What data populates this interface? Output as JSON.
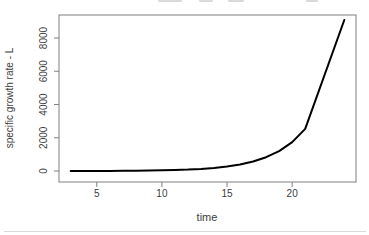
{
  "window": {
    "background_color": "#ffffff"
  },
  "chart_data": {
    "type": "line",
    "title": "",
    "xlabel": "time",
    "ylabel": "specific growth rate - L",
    "x": [
      3,
      4,
      5,
      6,
      7,
      8,
      9,
      10,
      11,
      12,
      13,
      14,
      15,
      16,
      17,
      18,
      19,
      20,
      21,
      24
    ],
    "y": [
      3,
      5,
      7,
      10,
      14,
      20,
      29,
      42,
      61,
      88,
      128,
      186,
      270,
      390,
      570,
      830,
      1200,
      1740,
      2530,
      9080
    ],
    "xticks": [
      5,
      10,
      15,
      20
    ],
    "yticks": [
      0,
      2000,
      4000,
      6000,
      8000
    ],
    "xlim": [
      2.1,
      24.9
    ],
    "ylim": [
      -660,
      9380
    ],
    "grid": false,
    "legend": "none",
    "line_color": "#000000",
    "line_width": 2,
    "axis_color": "#808080",
    "tick_label_color": "#3d3d3d",
    "axis_label_color": "#3d3d3d"
  }
}
